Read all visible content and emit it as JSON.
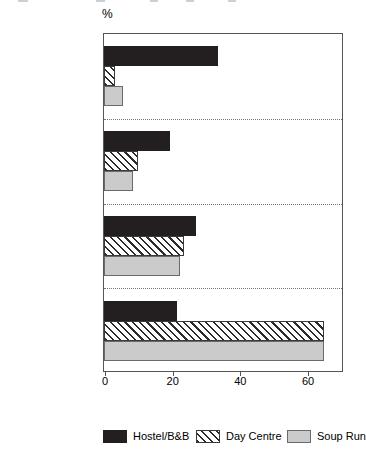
{
  "chart_data": {
    "type": "bar",
    "orientation": "horizontal",
    "title": "",
    "subtitle": "",
    "xlabel": "",
    "ylabel": "",
    "unit_label": "%",
    "xlim": [
      0,
      71
    ],
    "xticks": [
      0,
      20,
      40,
      60
    ],
    "xtick_labels": [
      "0",
      "20",
      "40",
      "60"
    ],
    "grid": false,
    "group_separators": true,
    "legend_position": "bottom",
    "categories": [
      "< 1 week",
      "1 week < 1 month",
      "1 month < 6 months",
      "6 months or more"
    ],
    "series": [
      {
        "name": "Hostel/B&B",
        "pattern": "solid",
        "color": "#231f20",
        "values": [
          33,
          19,
          26.5,
          21
        ]
      },
      {
        "name": "Day Centre",
        "pattern": "diagonal-hatch",
        "color": "#ffffff",
        "values": [
          2.5,
          9.5,
          23,
          64.5
        ]
      },
      {
        "name": "Soup Run",
        "pattern": "solid-light",
        "color": "#cbcbcb",
        "values": [
          5,
          8,
          22,
          64.5
        ]
      }
    ]
  },
  "legend": {
    "items": [
      {
        "label": "Hostel/B&B"
      },
      {
        "label": "Day Centre"
      },
      {
        "label": "Soup Run"
      }
    ]
  },
  "colors": {
    "hostel": "#231f20",
    "day_centre": "#ffffff",
    "soup_run": "#cbcbcb",
    "axis": "#555555",
    "separator": "#777777"
  }
}
